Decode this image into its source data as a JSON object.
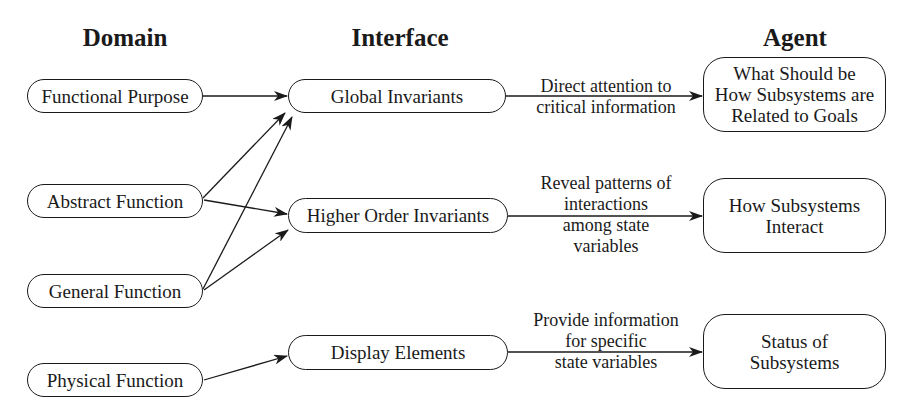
{
  "columns": {
    "domain": "Domain",
    "interface": "Interface",
    "agent": "Agent"
  },
  "domain_nodes": [
    {
      "id": "functional-purpose",
      "label": "Functional Purpose"
    },
    {
      "id": "abstract-function",
      "label": "Abstract Function"
    },
    {
      "id": "general-function",
      "label": "General Function"
    },
    {
      "id": "physical-function",
      "label": "Physical Function"
    }
  ],
  "interface_nodes": [
    {
      "id": "global-invariants",
      "label": "Global Invariants"
    },
    {
      "id": "higher-order-invariants",
      "label": "Higher Order Invariants"
    },
    {
      "id": "display-elements",
      "label": "Display Elements"
    }
  ],
  "agent_nodes": [
    {
      "id": "what-should-be",
      "lines": [
        "What Should be",
        "How Subsystems are",
        "Related to Goals"
      ]
    },
    {
      "id": "how-subsystems-interact",
      "lines": [
        "How Subsystems",
        "Interact"
      ]
    },
    {
      "id": "status-of-subsystems",
      "lines": [
        "Status of",
        "Subsystems"
      ]
    }
  ],
  "edge_labels": [
    {
      "lines": [
        "Direct attention to",
        "critical information"
      ]
    },
    {
      "lines": [
        "Reveal patterns of",
        "interactions",
        "among state",
        "variables"
      ]
    },
    {
      "lines": [
        "Provide information",
        "for specific",
        "state variables"
      ]
    }
  ],
  "edges": [
    {
      "from": "functional-purpose",
      "to": "global-invariants"
    },
    {
      "from": "abstract-function",
      "to": "global-invariants"
    },
    {
      "from": "general-function",
      "to": "global-invariants"
    },
    {
      "from": "abstract-function",
      "to": "higher-order-invariants"
    },
    {
      "from": "general-function",
      "to": "higher-order-invariants"
    },
    {
      "from": "physical-function",
      "to": "display-elements"
    },
    {
      "from": "global-invariants",
      "to": "what-should-be"
    },
    {
      "from": "higher-order-invariants",
      "to": "how-subsystems-interact"
    },
    {
      "from": "display-elements",
      "to": "status-of-subsystems"
    }
  ],
  "colors": {
    "stroke": "#1a1a1a",
    "background": "#ffffff"
  }
}
